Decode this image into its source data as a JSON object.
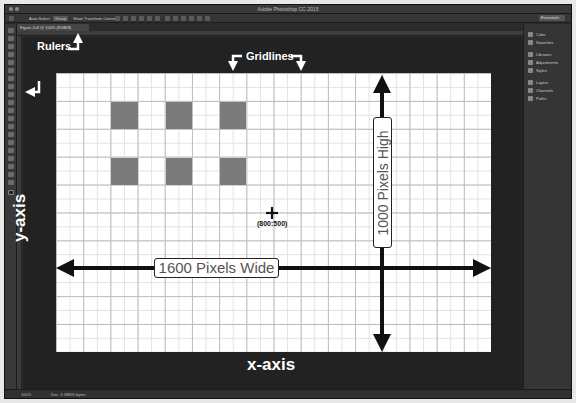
{
  "window": {
    "title": "Adobe Photoshop CC 2015"
  },
  "options_bar": {
    "items": [
      "Auto-Select:",
      "Group",
      "Show Transform Controls"
    ],
    "workspace": "Essentials"
  },
  "document_tab": {
    "label": "Figure 4.tif @ 100% (RGB/8)"
  },
  "dock_panels": [
    {
      "label": "Color",
      "icon": "color-icon"
    },
    {
      "label": "Swatches",
      "icon": "swatches-icon"
    },
    {
      "label": "Libraries",
      "icon": "libraries-icon"
    },
    {
      "label": "Adjustments",
      "icon": "adjustments-icon"
    },
    {
      "label": "Styles",
      "icon": "styles-icon"
    },
    {
      "label": "Layers",
      "icon": "layers-icon"
    },
    {
      "label": "Channels",
      "icon": "channels-icon"
    },
    {
      "label": "Paths",
      "icon": "paths-icon"
    }
  ],
  "status_bar": {
    "zoom": "100%",
    "doc_info": "Doc: 4.58M/0 bytes"
  },
  "annotations": {
    "rulers": "Rulers",
    "gridlines": "Gridlines",
    "y_axis": "y-axis",
    "x_axis": "x-axis",
    "width_label": "1600 Pixels Wide",
    "height_label": "1000 Pixels High",
    "center_coord": "(800:500)"
  },
  "canvas": {
    "width_px": 1600,
    "height_px": 1000,
    "grid_columns": 16,
    "grid_rows": 10,
    "square_color": "#7b7b7b",
    "squares": [
      {
        "col": 2,
        "row": 1
      },
      {
        "col": 4,
        "row": 1
      },
      {
        "col": 6,
        "row": 1
      },
      {
        "col": 2,
        "row": 3
      },
      {
        "col": 4,
        "row": 3
      },
      {
        "col": 6,
        "row": 3
      }
    ]
  }
}
